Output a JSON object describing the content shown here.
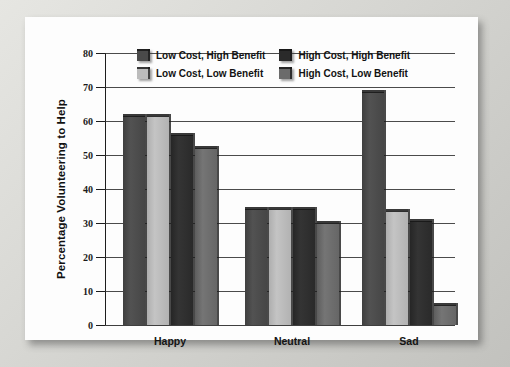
{
  "figure": {
    "caption": ""
  },
  "chart_data": {
    "type": "bar",
    "title": "",
    "xlabel": "",
    "ylabel": "Percentage Volunteering to Help",
    "categories": [
      "Happy",
      "Neutral",
      "Sad"
    ],
    "ylim": [
      0,
      80
    ],
    "yticks": [
      0,
      10,
      20,
      30,
      40,
      50,
      60,
      70,
      80
    ],
    "ytick_labels": [
      "0",
      "10",
      "20",
      "30",
      "40",
      "50",
      "60",
      "70",
      "80"
    ],
    "grid": true,
    "legend_position": "top-center",
    "series": [
      {
        "name": "Low Cost, High Benefit",
        "color": "#4a4a4a",
        "values": [
          61.5,
          34.0,
          68.5
        ]
      },
      {
        "name": "Low Cost, Low Benefit",
        "color": "#bcbcbc",
        "values": [
          61.5,
          34.0,
          33.5
        ]
      },
      {
        "name": "High Cost, High Benefit",
        "color": "#2a2a2a",
        "values": [
          56.0,
          34.0,
          30.5
        ]
      },
      {
        "name": "High Cost, Low Benefit",
        "color": "#6b6b6b",
        "values": [
          52.0,
          30.0,
          6.0
        ]
      }
    ]
  }
}
